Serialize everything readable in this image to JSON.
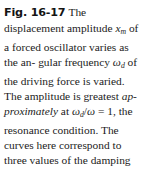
{
  "figure": {
    "label": "Fig. 16-17",
    "caption_full": "Fig. 16-17 The displacement amplitude xm of a forced oscillator varies as the angular frequency ωd of the driving force is varied. The amplitude is greatest approximately at ωd/ω = 1, the resonance condition. The curves here correspond to three values of the damping constant b.",
    "text": {
      "t1": "The displacement",
      "t2": "amplitude",
      "t3": "of a forced",
      "t4": "oscillator varies as the an-",
      "t5": "gular frequency",
      "t6": "of the",
      "t7": "driving force is varied. The",
      "t8": "amplitude is greatest",
      "t9": "ap-",
      "t10": "proximately",
      "t11": "at",
      "t12": "= 1,",
      "t13": "the resonance condition.",
      "t14": "The curves here correspond",
      "t15": "to three values of the",
      "t16": "damping constant",
      "t17": "."
    },
    "symbols": {
      "x": "x",
      "x_sub": "m",
      "omega": "ω",
      "omega_sub": "d",
      "omega_plain": "ω",
      "slash": "/",
      "b": "b"
    },
    "colors": {
      "text": "#1b1b1b",
      "label": "#141414",
      "background": "#ffffff"
    }
  }
}
